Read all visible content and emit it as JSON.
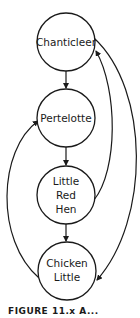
{
  "diagram": {
    "type": "directed-graph",
    "nodes": [
      {
        "id": "chanticleer",
        "lines": [
          "Chanticleer"
        ],
        "cx": 66,
        "cy": 42,
        "r": 29
      },
      {
        "id": "pertelotte",
        "lines": [
          "Pertelotte"
        ],
        "cx": 66,
        "cy": 118,
        "r": 29
      },
      {
        "id": "little-red-hen",
        "lines": [
          "Little",
          "Red",
          "Hen"
        ],
        "cx": 66,
        "cy": 195,
        "r": 29
      },
      {
        "id": "chicken-little",
        "lines": [
          "Chicken",
          "Little"
        ],
        "cx": 67,
        "cy": 271,
        "r": 29
      }
    ],
    "edges": [
      {
        "from": "Chanticleer",
        "to": "Pertelotte",
        "style": "straight"
      },
      {
        "from": "Pertelotte",
        "to": "Little Red Hen",
        "style": "straight"
      },
      {
        "from": "Little Red Hen",
        "to": "Chicken Little",
        "style": "straight"
      },
      {
        "from": "Little Red Hen",
        "to": "Chanticleer",
        "style": "curved-right-inner"
      },
      {
        "from": "Chanticleer",
        "to": "Chicken Little",
        "style": "curved-right-outer"
      },
      {
        "from": "Chicken Little",
        "to": "Pertelotte",
        "style": "curved-left"
      }
    ],
    "stroke_color": "#1a1a1a",
    "background_color": "#ffffff"
  },
  "labels": {
    "chanticleer": "Chanticleer",
    "pertelotte": "Pertelotte",
    "little_red_hen_1": "Little",
    "little_red_hen_2": "Red",
    "little_red_hen_3": "Hen",
    "chicken_little_1": "Chicken",
    "chicken_little_2": "Little"
  },
  "caption": {
    "text": "FIGURE 11.x  A..."
  }
}
